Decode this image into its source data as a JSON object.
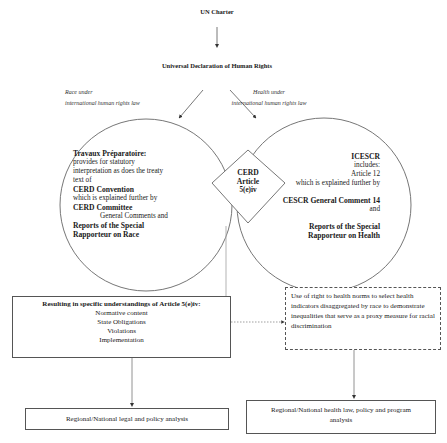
{
  "diagram": {
    "top_cut_text": "",
    "un_charter": "UN Charter",
    "udhr": "Universal Declaration of Human Rights",
    "race_label": {
      "line1": "Race under",
      "line2": "international human rights law"
    },
    "health_label": {
      "line1": "Health under",
      "line2": "international human rights law"
    },
    "left_circle": {
      "line1": "Travaux Préparatoire:",
      "line2": "provides for statutory",
      "line3": "interpretation as does the treaty",
      "line4": "text of",
      "line5": "CERD Convention",
      "line6": "which is explained further by",
      "line7": "CERD Committee",
      "line8": "General Comments and",
      "line9": "Reports of the Special",
      "line10": "Rapporteur on Race"
    },
    "center_diamond": {
      "line1": "CERD",
      "line2": "Article",
      "line3": "5(e)iv"
    },
    "right_circle": {
      "line1": "ICESCR",
      "line2": "includes:",
      "line3": "Article 12",
      "line4": "which is explained further by",
      "line5": "CESCR General Comment 14",
      "line6": "and",
      "line7": "Reports of the Special",
      "line8": "Rapporteur on Health"
    },
    "left_result_box": {
      "title": "Resulting in specific understandings of Article 5(e)iv:",
      "items": [
        "Normative content",
        "State Obligations",
        "Violations",
        "Implementation"
      ]
    },
    "right_dashed_box": {
      "text": "Use of right to health norms to select health indicators disaggregated by race to demonstrate inequalities that serve as a proxy measure for racial discrimination"
    },
    "bottom_left_box": "Regional/National legal and policy analysis",
    "bottom_right_box": "Regional/National health law, policy and program analysis",
    "colors": {
      "line": "#555555",
      "text": "#1a1a1a",
      "background": "#ffffff"
    }
  }
}
